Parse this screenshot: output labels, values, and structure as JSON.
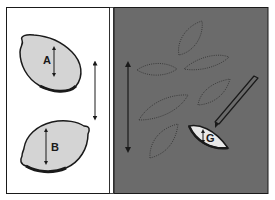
{
  "diagram": {
    "left_panel": {
      "background": "#ffffff",
      "seeds": [
        {
          "label": "A",
          "fill": "#d4d4d4"
        },
        {
          "label": "B",
          "fill": "#d4d4d4"
        }
      ],
      "arrow": "double-headed-vertical"
    },
    "right_panel": {
      "background": "#6b6b6b",
      "traced_leaves": 6,
      "arrow": "double-headed-vertical",
      "tool": "pencil",
      "highlighted_leaf": {
        "label": "G",
        "fill": "#e8e8e8"
      }
    },
    "colors": {
      "outline": "#1a1a1a",
      "dotted": "#3a3a3a"
    }
  }
}
